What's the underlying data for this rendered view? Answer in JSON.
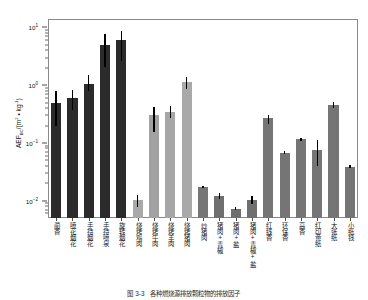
{
  "chart_data": {
    "type": "bar",
    "title": "",
    "xlabel": "",
    "ylabel": "AEF_BC/(m^2 * kg^-1)",
    "ylabel_parts": {
      "base": "AEF",
      "sub": "BC",
      "unit": "/(m",
      "unit_sup": "2",
      "unit_mid": " • kg",
      "unit_sup2": "-1",
      "unit_end": ")"
    },
    "yscale": "log",
    "ylim": [
      0.005,
      14
    ],
    "grid": false,
    "legend": "none",
    "ytick_labels": [
      "10¹",
      "10⁰",
      "10⁻¹",
      "10⁻²"
    ],
    "ytick_values": [
      10,
      1,
      0.1,
      0.01
    ],
    "categories": [
      "蔺香",
      "喷花烟花",
      "手持烟花",
      "手持喷泉",
      "旋转烟花",
      "烧烤鸡肉",
      "烧烤牛肉",
      "烧烤羊肉",
      "烧烤猪肉",
      "炒猪肉",
      "猪肉+青椒",
      "猪肉+盐",
      "猪肉+青椒+盐",
      "红线香",
      "环保香",
      "高香",
      "红印黄纸",
      "大张纸",
      "小纸钱"
    ],
    "values": [
      0.5,
      0.6,
      1.05,
      5.0,
      6.0,
      0.0103,
      0.3,
      0.35,
      1.15,
      0.0175,
      0.0122,
      0.0072,
      0.0103,
      0.27,
      0.067,
      0.115,
      0.075,
      0.45,
      0.039
    ],
    "err_low": [
      0.2,
      0.37,
      0.8,
      2.1,
      2.6,
      0.0078,
      0.155,
      0.265,
      0.86,
      0.0168,
      0.0108,
      0.0068,
      0.0088,
      0.215,
      0.063,
      0.108,
      0.04,
      0.395,
      0.037
    ],
    "err_high": [
      0.78,
      0.82,
      1.5,
      7.6,
      8.8,
      0.0125,
      0.42,
      0.44,
      1.4,
      0.0182,
      0.0136,
      0.0077,
      0.012,
      0.305,
      0.071,
      0.122,
      0.112,
      0.505,
      0.041
    ],
    "bar_colors": [
      "#2b2b2b",
      "#2b2b2b",
      "#2b2b2b",
      "#2b2b2b",
      "#2b2b2b",
      "#a9a9a9",
      "#a2a2a2",
      "#a6a6a6",
      "#a9a9a9",
      "#767676",
      "#6f6f6f",
      "#6f6f6f",
      "#6f6f6f",
      "#757575",
      "#757575",
      "#757575",
      "#757575",
      "#757575",
      "#757575"
    ],
    "error_bar_color": "#000000",
    "axis_color": "#8a8a8a"
  },
  "caption": {
    "text": "图 3-3　各种燃烧源排放颗粒物的排放因子"
  }
}
